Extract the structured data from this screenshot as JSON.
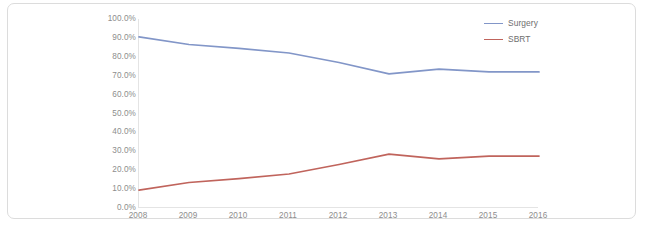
{
  "chart_data": {
    "type": "line",
    "title": "",
    "subtitle": "",
    "xlabel": "",
    "ylabel": "",
    "categories": [
      "2008",
      "2009",
      "2010",
      "2011",
      "2012",
      "2013",
      "2014",
      "2015",
      "2016"
    ],
    "x": [
      2008,
      2009,
      2010,
      2011,
      2012,
      2013,
      2014,
      2015,
      2016
    ],
    "series": [
      {
        "name": "Surgery",
        "color": "#8296c8",
        "values": [
          90.5,
          86.5,
          84.5,
          82.0,
          77.0,
          71.0,
          73.5,
          72.0,
          72.0
        ]
      },
      {
        "name": "SBRT",
        "color": "#c0645c",
        "values": [
          9.5,
          13.5,
          15.5,
          18.0,
          23.0,
          28.5,
          26.0,
          27.5,
          27.5
        ]
      }
    ],
    "ylim": [
      0,
      100
    ],
    "ytick_values": [
      100,
      90,
      80,
      70,
      60,
      50,
      40,
      30,
      20,
      10,
      0
    ],
    "ytick_labels": [
      "100.0%",
      "90.0%",
      "80.0%",
      "70.0%",
      "60.0%",
      "50.0%",
      "40.0%",
      "30.0%",
      "20.0%",
      "10.0%",
      "0.0%"
    ],
    "grid": false,
    "legend_position": "top-right",
    "legend_entries": [
      "Surgery",
      "SBRT"
    ],
    "annotations": []
  },
  "colors": {
    "surgery_line": "#8296c8",
    "sbrt_line": "#c0645c",
    "axis_line": "#e4e4e4",
    "tick_text": "#8d8d8d",
    "legend_text": "#6e6e6e",
    "frame_border": "#dcdcdc",
    "plot_background": "#ffffff"
  }
}
